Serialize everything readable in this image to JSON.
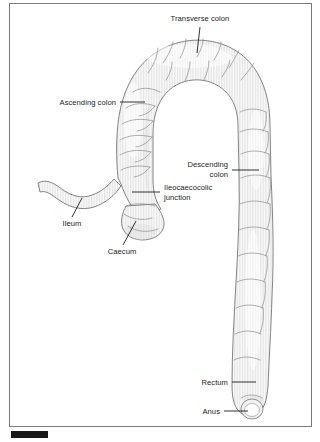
{
  "figure": {
    "frame_color": "#7b7b7b",
    "background_color": "#ffffff",
    "tissue_fill_color": "#e8e8e8",
    "outline_color": "#6e6e6e",
    "label_color": "#1c1c1c",
    "scale_bar_color": "#1a1a1a"
  },
  "labels": [
    {
      "id": "transverse-colon",
      "text": "Transverse colon",
      "line1": "Transverse colon",
      "line2": "",
      "align": "center"
    },
    {
      "id": "ascending-colon",
      "text": "Ascending colon",
      "line1": "Ascending colon",
      "line2": "",
      "align": "end"
    },
    {
      "id": "descending-colon",
      "text": "Descending colon",
      "line1": "Descending",
      "line2": "colon",
      "align": "end"
    },
    {
      "id": "ileocaecocolic-junction",
      "text": "Ileocaecocolic junction",
      "line1": "Ileocaecocolic",
      "line2": "junction",
      "align": "start"
    },
    {
      "id": "ileum",
      "text": "Ileum",
      "line1": "Ileum",
      "line2": "",
      "align": "middle"
    },
    {
      "id": "caecum",
      "text": "Caecum",
      "line1": "Caecum",
      "line2": "",
      "align": "middle"
    },
    {
      "id": "rectum",
      "text": "Rectum",
      "line1": "Rectum",
      "line2": "",
      "align": "end"
    },
    {
      "id": "anus",
      "text": "Anus",
      "line1": "Anus",
      "line2": "",
      "align": "end"
    }
  ]
}
